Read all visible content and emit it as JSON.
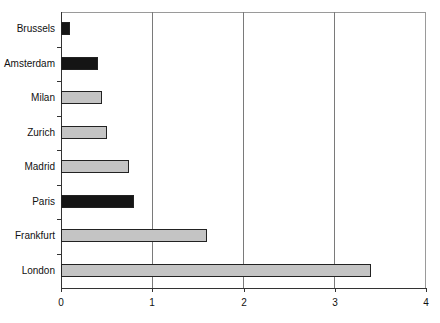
{
  "chart_data": {
    "type": "bar",
    "orientation": "horizontal",
    "title": "",
    "xlabel": "",
    "ylabel": "",
    "categories": [
      "Brussels",
      "Amsterdam",
      "Milan",
      "Zurich",
      "Madrid",
      "Paris",
      "Frankfurt",
      "London"
    ],
    "values": [
      0.1,
      0.4,
      0.45,
      0.5,
      0.75,
      0.8,
      1.6,
      3.4
    ],
    "bar_styles": [
      "dark",
      "dark",
      "light",
      "light",
      "light",
      "dark",
      "light",
      "light"
    ],
    "colors": {
      "dark": "#151515",
      "light": "#c4c4c4"
    },
    "xlim": [
      0,
      4
    ],
    "xticks": [
      "0",
      "1",
      "2",
      "3",
      "4"
    ],
    "grid": {
      "vertical": true,
      "horizontal": false
    },
    "legend": null
  }
}
